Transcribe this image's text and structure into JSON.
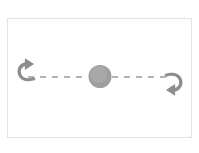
{
  "figure": {
    "kind": "diagram",
    "title": "",
    "caption": "",
    "canvas": {
      "width": 199,
      "height": 153,
      "background_color": "#ffffff"
    },
    "frame": {
      "name": "figure-border",
      "x": 7.5,
      "y": 18.5,
      "width": 184,
      "height": 119,
      "stroke_color": "#e3e3e3",
      "fill_color": "#ffffff"
    },
    "palette": {
      "stroke_gray": "#9a9a9a",
      "arrow_gray": "#8d8d8d",
      "blob_gray": "#9e9e9e",
      "frame_gray": "#e3e3e3",
      "background": "#ffffff"
    }
  },
  "chart_data": {
    "type": "diagram",
    "title": "",
    "subtitle": "",
    "xlabel": "",
    "ylabel": "",
    "legend": [],
    "annotations": [],
    "elements": [
      {
        "id": "axis-left-segment",
        "role": "dashed-motion-path",
        "label": "",
        "shape": "dashed-line",
        "x1": 28,
        "y1": 77,
        "x2": 88,
        "y2": 77,
        "color": "#9a9a9a",
        "dash": "6 6",
        "width": 1.7
      },
      {
        "id": "axis-right-segment",
        "role": "dashed-motion-path",
        "label": "",
        "shape": "dashed-line",
        "x1": 112,
        "y1": 77,
        "x2": 170,
        "y2": 77,
        "color": "#9a9a9a",
        "dash": "6 6",
        "width": 1.7
      },
      {
        "id": "center-body",
        "role": "central-mass",
        "label": "",
        "shape": "circle",
        "cx": 100,
        "cy": 76.5,
        "r": 11.5,
        "color": "#9e9e9e"
      },
      {
        "id": "arrow-left",
        "role": "direction-indicator",
        "label": "",
        "shape": "curved-hook-arrow",
        "direction": "left",
        "tip_x": 18,
        "tip_y": 68,
        "color": "#8d8d8d"
      },
      {
        "id": "arrow-right",
        "role": "direction-indicator",
        "label": "",
        "shape": "curved-hook-arrow",
        "direction": "right",
        "tip_x": 182,
        "tip_y": 86,
        "color": "#8d8d8d"
      }
    ]
  }
}
